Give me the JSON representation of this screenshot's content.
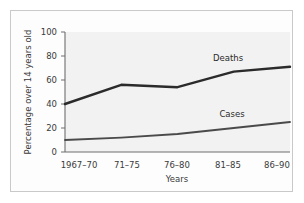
{
  "chart_data": {
    "type": "line",
    "title": "",
    "xlabel": "Years",
    "ylabel": "Percentage over 14 years old",
    "categories": [
      "1967–70",
      "71–75",
      "76–80",
      "81–85",
      "86–90"
    ],
    "ylim": [
      0,
      100
    ],
    "yticks": [
      0,
      20,
      40,
      60,
      80,
      100
    ],
    "ytick_labels": [
      "0",
      "20",
      "40",
      "60",
      "80",
      "100"
    ],
    "grid": false,
    "legend_position": "inline-labels",
    "series": [
      {
        "name": "Deaths",
        "values": [
          40,
          56,
          54,
          67,
          71
        ],
        "color": "#2b2b2b",
        "line_width": 2.4
      },
      {
        "name": "Cases",
        "values": [
          10,
          12,
          15,
          20,
          25
        ],
        "color": "#4a4a4a",
        "line_width": 1.8
      }
    ],
    "annotations": [
      {
        "text": "Deaths",
        "series": "Deaths"
      },
      {
        "text": "Cases",
        "series": "Cases"
      }
    ],
    "colors": {
      "plot_background": "#f2f2f2",
      "axis": "#6e6e6e",
      "frame_border": "#c9c9c9",
      "text": "#3a3a3a"
    }
  }
}
